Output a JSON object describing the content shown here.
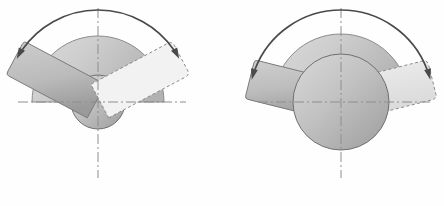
{
  "figure": {
    "title": "Rotary actuator swing-angle comparison",
    "background_color": "#fefefe",
    "width": 444,
    "height": 206,
    "panel_count": 2
  },
  "style": {
    "semicircle_fill_light": "#d2d2d2",
    "semicircle_fill_dark": "#b4b4b4",
    "semicircle_stroke": "#8c8c8c",
    "hub_fill_light": "#cccccc",
    "hub_fill_dark": "#a8a8a8",
    "hub_stroke": "#6f6f6f",
    "lever_fill_light": "#c4c4c4",
    "lever_fill_dark": "#9e9e9e",
    "lever_stroke": "#7a7a7a",
    "phantom_fill": "#f0f0f0",
    "phantom_fill_right": "#e2e2e2",
    "phantom_stroke": "#8a8a8a",
    "centerline_color": "#8e8e8e",
    "arrow_color": "#4a4a4a",
    "centerline_dash": "10 3 2 3",
    "phantom_dash": "3 2.5"
  },
  "panels": [
    {
      "id": "left",
      "name": "narrow-swing-panel",
      "center": {
        "x": 98,
        "y": 102
      },
      "semicircle": {
        "radius": 66,
        "start_angle_deg": 180,
        "end_angle_deg": 360
      },
      "hub": {
        "radius": 27
      },
      "lever_solid": {
        "angle_deg": 208,
        "length": 94,
        "half_width": 19,
        "corner_radius": 3
      },
      "lever_phantom": {
        "angle_deg": 332,
        "length": 94,
        "half_width": 19,
        "corner_radius": 5
      },
      "swing_arrow": {
        "radius": 92,
        "start_angle_deg": 208,
        "end_angle_deg": 332,
        "span_deg": 124,
        "double_headed": true,
        "head_length": 11,
        "head_width": 7
      },
      "centerlines": {
        "vertical": {
          "x": 98,
          "y1": 8,
          "y2": 178
        },
        "horizontal": {
          "y": 102,
          "x1": 18,
          "x2": 186
        }
      }
    },
    {
      "id": "right",
      "name": "wide-swing-panel",
      "center": {
        "x": 341,
        "y": 102
      },
      "semicircle": {
        "radius": 68,
        "start_angle_deg": 180,
        "end_angle_deg": 360
      },
      "hub": {
        "radius": 48
      },
      "lever_solid": {
        "angle_deg": 194,
        "length": 94,
        "half_width": 20,
        "corner_radius": 3
      },
      "lever_phantom": {
        "angle_deg": 346,
        "length": 94,
        "half_width": 20,
        "corner_radius": 5
      },
      "swing_arrow": {
        "radius": 92,
        "start_angle_deg": 194,
        "end_angle_deg": 346,
        "span_deg": 152,
        "double_headed": true,
        "head_length": 11,
        "head_width": 7
      },
      "centerlines": {
        "vertical": {
          "x": 341,
          "y1": 8,
          "y2": 178
        },
        "horizontal": {
          "y": 102,
          "x1": 258,
          "x2": 432
        }
      }
    }
  ],
  "labels": {
    "left_panel_caption": "",
    "right_panel_caption": "",
    "angle_annotation": ""
  }
}
